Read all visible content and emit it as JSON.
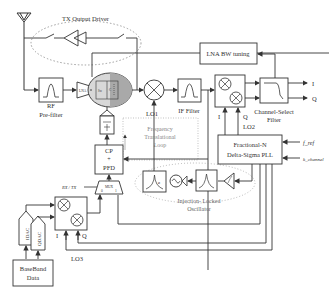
{
  "diagram": {
    "type": "RF transceiver block diagram",
    "blocks": {
      "tx_output_driver": "TX Output Driver",
      "rf_prefilter": [
        "RF",
        "Pre-filter"
      ],
      "lna_bw_tuning": "LNA BW tuning",
      "if_filter": "IF Filter",
      "channel_select_filter": [
        "Channel-Select",
        "Filter"
      ],
      "frequency_translational_loop": [
        "Frequency",
        "Translational",
        "Loop"
      ],
      "cp_pfd": [
        "CP",
        "+",
        "PFD"
      ],
      "mux": "MUX",
      "mux_inputs": [
        "0",
        "1"
      ],
      "fractional_n_pll": [
        "Fractional-N",
        "Delta-Sigma PLL"
      ],
      "injection_locked_oscillator": [
        "Injection- Locked",
        "Oscillator"
      ],
      "baseband_data": [
        "BaseBand",
        "Data"
      ],
      "idac": "IDAC",
      "qdac": "QDAC",
      "lna_label": "LNA",
      "switch_label": "Sw",
      "cap_label": "C"
    },
    "signals": {
      "lo1": "LO1",
      "lo2": "LO2",
      "lo3": "LO3",
      "i_out": "I",
      "q_out": "Q",
      "i_lo2": "I",
      "q_lo2": "Q",
      "i_lo3": "I",
      "q_lo3": "Q",
      "f_ref": "f_ref",
      "k_channel": "k_channel",
      "rx_tx": "RX / TX"
    }
  }
}
